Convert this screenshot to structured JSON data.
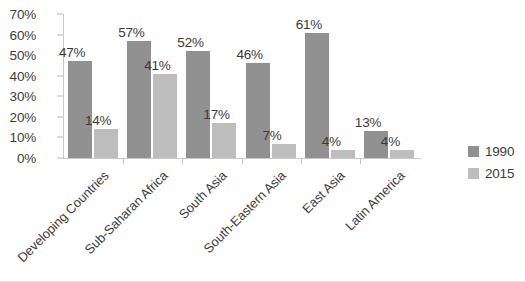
{
  "chart_data": {
    "type": "bar",
    "title": "",
    "xlabel": "",
    "ylabel": "",
    "ylim": [
      0,
      70
    ],
    "grid": false,
    "legend_position": "right",
    "categories": [
      "Developing Countries",
      "Sub-Saharan Africa",
      "South Asia",
      "South-Eastern Asia",
      "East Asia",
      "Latin America"
    ],
    "y_ticks": [
      "0%",
      "10%",
      "20%",
      "30%",
      "40%",
      "50%",
      "60%",
      "70%"
    ],
    "y_tick_values": [
      0,
      10,
      20,
      30,
      40,
      50,
      60,
      70
    ],
    "series": [
      {
        "name": "1990",
        "color": "#919191",
        "values": [
          47,
          57,
          52,
          46,
          61,
          13
        ],
        "labels": [
          "47%",
          "57%",
          "52%",
          "46%",
          "61%",
          "13%"
        ]
      },
      {
        "name": "2015",
        "color": "#bdbdbd",
        "values": [
          14,
          41,
          17,
          7,
          4,
          4
        ],
        "labels": [
          "14%",
          "41%",
          "17%",
          "7%",
          "4%",
          "4%"
        ]
      }
    ]
  },
  "legend": {
    "items": [
      {
        "label": "1990",
        "color": "#919191"
      },
      {
        "label": "2015",
        "color": "#bdbdbd"
      }
    ]
  }
}
